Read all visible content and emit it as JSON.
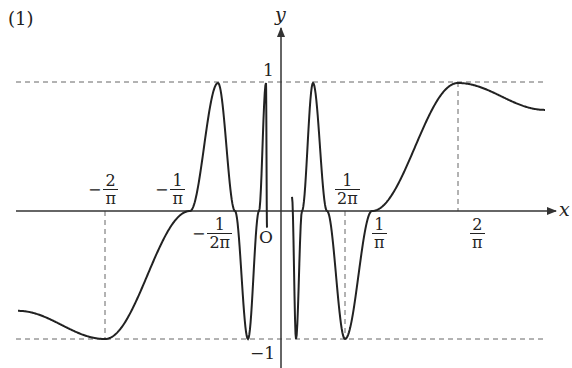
{
  "figure": {
    "part_label": "(1)",
    "axis_labels": {
      "x": "x",
      "y": "y",
      "origin": "O"
    },
    "y_tick_labels": {
      "one": "1",
      "minus_one": "−1"
    },
    "x_tick_labels": [
      {
        "id": "neg_two_over_pi",
        "sign": "−",
        "num": "2",
        "den": "π"
      },
      {
        "id": "neg_one_over_pi",
        "sign": "−",
        "num": "1",
        "den": "π"
      },
      {
        "id": "neg_one_over_two_pi",
        "sign": "−",
        "num": "1",
        "den": "2π"
      },
      {
        "id": "one_over_two_pi",
        "sign": "",
        "num": "1",
        "den": "2π"
      },
      {
        "id": "one_over_pi",
        "sign": "",
        "num": "1",
        "den": "π"
      },
      {
        "id": "two_over_pi",
        "sign": "",
        "num": "2",
        "den": "π"
      }
    ]
  },
  "colors": {
    "curve": "#222222",
    "axis": "#333333",
    "dashed": "#666666",
    "background": "#ffffff"
  },
  "chart_data": {
    "type": "line",
    "title": "(1)",
    "function": "y = sin(1/x) (schematic)",
    "xlabel": "x",
    "ylabel": "y",
    "ylim": [
      -1,
      1
    ],
    "x_ticks": [
      "-2/π",
      "-1/π",
      "-1/(2π)",
      "O",
      "1/(2π)",
      "1/π",
      "2/π"
    ],
    "y_ticks": [
      "1",
      "-1"
    ],
    "grid": false,
    "reference_lines": {
      "horizontal_dashed": [
        1,
        -1
      ],
      "vertical_dashed": [
        "-2/π",
        "1/(2π)",
        "2/π"
      ]
    },
    "key_points": [
      {
        "x": "-2/π",
        "y": -1,
        "kind": "minimum"
      },
      {
        "x": "-1/π",
        "y": 0,
        "kind": "zero"
      },
      {
        "x": "-1/(2π)",
        "y": 0,
        "kind": "zero"
      },
      {
        "x": "1/(2π)",
        "y": 0,
        "kind": "zero"
      },
      {
        "x": "1/π",
        "y": 0,
        "kind": "zero"
      },
      {
        "x": "2/π",
        "y": 1,
        "kind": "maximum"
      }
    ],
    "series": [
      {
        "name": "left branch (x<0)",
        "screen_points": [
          [
            18,
            -0.78
          ],
          [
            105,
            -1
          ],
          [
            190,
            0
          ],
          [
            218,
            1
          ],
          [
            235,
            0
          ],
          [
            248,
            -1
          ],
          [
            259,
            0
          ],
          [
            266,
            1
          ],
          [
            267,
            -0.13
          ]
        ]
      },
      {
        "name": "right branch (x>0)",
        "screen_points": [
          [
            292,
            0.11
          ],
          [
            296,
            -1
          ],
          [
            302,
            0
          ],
          [
            313,
            1
          ],
          [
            327,
            0
          ],
          [
            345,
            -1
          ],
          [
            372,
            0
          ],
          [
            458,
            1
          ],
          [
            545,
            0.79
          ]
        ]
      }
    ],
    "layout": {
      "origin_px": [
        281,
        211
      ],
      "amplitude_px": 128,
      "x_axis_px": [
        16,
        556
      ],
      "y_axis_px": [
        368,
        28
      ]
    }
  }
}
